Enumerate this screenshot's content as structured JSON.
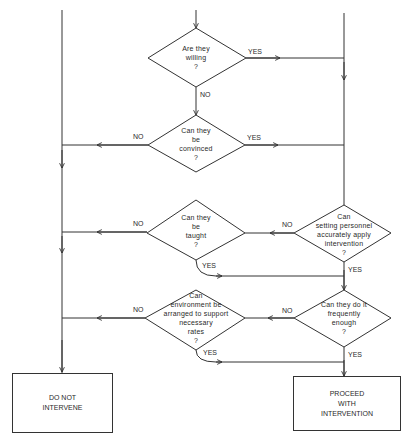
{
  "diagram": {
    "type": "flowchart",
    "decisions": [
      {
        "id": "willing",
        "lines": [
          "Are they",
          "willing",
          "?"
        ]
      },
      {
        "id": "convinced",
        "lines": [
          "Can they",
          "be",
          "convinced",
          "?"
        ]
      },
      {
        "id": "taught",
        "lines": [
          "Can they",
          "be",
          "taught",
          "?"
        ]
      },
      {
        "id": "accurately",
        "lines": [
          "Can",
          "setting personnel",
          "accurately apply",
          "intervention",
          "?"
        ]
      },
      {
        "id": "environment",
        "lines": [
          "Can",
          "environment be",
          "arranged to support",
          "necessary",
          "rates",
          "?"
        ]
      },
      {
        "id": "frequently",
        "lines": [
          "Can they do it",
          "frequently",
          "enough",
          "?"
        ]
      }
    ],
    "terminals": [
      {
        "id": "do-not-intervene",
        "lines": [
          "DO NOT",
          "INTERVENE"
        ]
      },
      {
        "id": "proceed",
        "lines": [
          "PROCEED",
          "WITH",
          "INTERVENTION"
        ]
      }
    ],
    "edge_labels": {
      "yes": "YES",
      "no": "NO"
    },
    "colors": {
      "line": "#333333",
      "text": "#2a2a2a",
      "background": "#ffffff"
    }
  }
}
